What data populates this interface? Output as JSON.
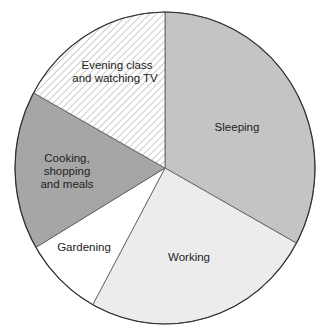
{
  "chart_data": {
    "type": "pie",
    "title": "",
    "start_angle_deg": 0,
    "direction": "clockwise",
    "slices": [
      {
        "label": "Sleeping",
        "lines": [
          "Sleeping"
        ],
        "value": 33,
        "color": "#c4c4c4",
        "pattern": "solid"
      },
      {
        "label": "Working",
        "lines": [
          "Working"
        ],
        "value": 25,
        "color": "#ececec",
        "pattern": "solid"
      },
      {
        "label": "Gardening",
        "lines": [
          "Gardening"
        ],
        "value": 8.5,
        "color": "#ffffff",
        "pattern": "solid"
      },
      {
        "label": "Cooking, shopping and meals",
        "lines": [
          "Cooking,",
          "shopping",
          "and meals"
        ],
        "value": 16.5,
        "color": "#a6a6a6",
        "pattern": "solid"
      },
      {
        "label": "Evening class and watching TV",
        "lines": [
          "Evening class",
          "and watching TV"
        ],
        "value": 17,
        "color": "#ffffff",
        "pattern": "hatch"
      }
    ],
    "legend": "none",
    "units": "percent (estimated from slice angles)"
  },
  "labels": {
    "sleeping": "Sleeping",
    "working": "Working",
    "gardening": "Gardening",
    "cooking_1": "Cooking,",
    "cooking_2": "shopping",
    "cooking_3": "and meals",
    "evening_1": "Evening class",
    "evening_2": "and watching TV"
  }
}
